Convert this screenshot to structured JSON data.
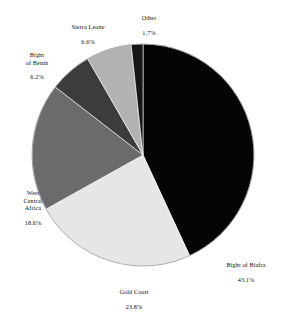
{
  "chart_data": {
    "type": "pie",
    "title": "",
    "subtitle": "",
    "xlabel": "",
    "ylabel": "",
    "legend_position": "none",
    "grid": false,
    "labels_on_slices": false,
    "start_angle_deg": 0,
    "direction": "clockwise",
    "units": "percent",
    "categories": [
      "Bight of Biafra",
      "Gold Coast",
      "West Central Africa",
      "Bight of Benin",
      "Sierra Leone",
      "Other"
    ],
    "values": [
      43.1,
      23.8,
      18.6,
      6.2,
      6.6,
      1.7
    ],
    "colors": [
      "#050505",
      "#e6e6e6",
      "#6b6b6b",
      "#3c3c3c",
      "#b2b2b2",
      "#161616"
    ],
    "slices": [
      {
        "name": "Bight of Biafra",
        "value": 43.1,
        "value_text": "43.1%",
        "color": "#050505",
        "label_line1": "Bight of Biafra",
        "label_line2": "43.1%"
      },
      {
        "name": "Gold Coast",
        "value": 23.8,
        "value_text": "23.8%",
        "color": "#e6e6e6",
        "label_line1": "Gold Coast",
        "label_line2": "23.8%"
      },
      {
        "name": "West Central Africa",
        "value": 18.6,
        "value_text": "18.6%",
        "color": "#6b6b6b",
        "label_line1": "West\nCentral\nAfrica",
        "label_line2": "18.6%"
      },
      {
        "name": "Bight of Benin",
        "value": 6.2,
        "value_text": "6.2%",
        "color": "#3c3c3c",
        "label_line1": "Bight\nof Benin",
        "label_line2": "6.2%"
      },
      {
        "name": "Sierra Leone",
        "value": 6.6,
        "value_text": "6.6%",
        "color": "#b2b2b2",
        "label_line1": "Sierra Leone",
        "label_line2": "6.6%"
      },
      {
        "name": "Other",
        "value": 1.7,
        "value_text": "1.7%",
        "color": "#161616",
        "label_line1": "Other",
        "label_line2": "1.7%"
      }
    ]
  },
  "geometry": {
    "center_x": 143,
    "center_y": 155,
    "radius": 111
  }
}
